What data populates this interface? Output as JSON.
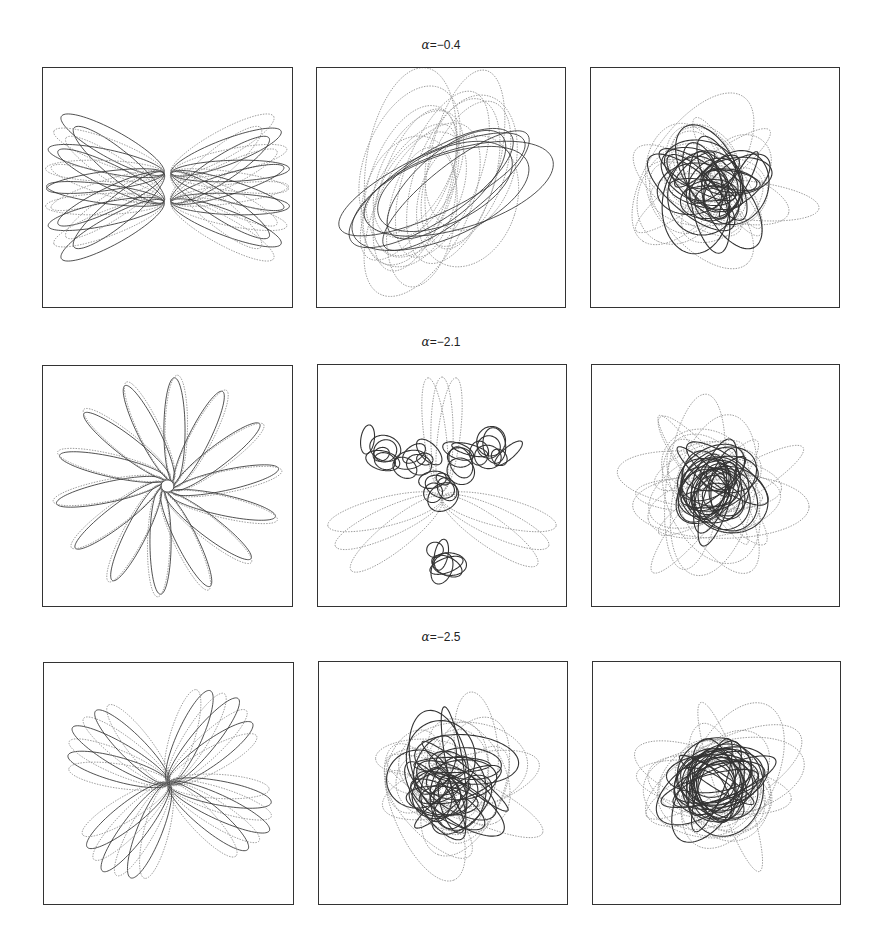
{
  "figure": {
    "rows": [
      {
        "label_symbol": "α",
        "label_value": "=−0.4",
        "panels": [
          {
            "type": "bowtie"
          },
          {
            "type": "tilted",
            "seed": 11
          },
          {
            "type": "chaos",
            "seed": 21,
            "spread": 0.55
          }
        ]
      },
      {
        "label_symbol": "α",
        "label_value": "=−2.1",
        "panels": [
          {
            "type": "rose",
            "petals": 14
          },
          {
            "type": "trefoil",
            "seed": 31
          },
          {
            "type": "chaos",
            "seed": 41,
            "spread": 0.35
          }
        ]
      },
      {
        "label_symbol": "α",
        "label_value": "=−2.5",
        "panels": [
          {
            "type": "clover"
          },
          {
            "type": "chaos",
            "seed": 51,
            "spread": 0.6
          },
          {
            "type": "chaos",
            "seed": 61,
            "spread": 0.3
          }
        ]
      }
    ],
    "colors": {
      "solid": "#333333",
      "dotted": "#9a9a9a",
      "frame": "#333333"
    }
  }
}
